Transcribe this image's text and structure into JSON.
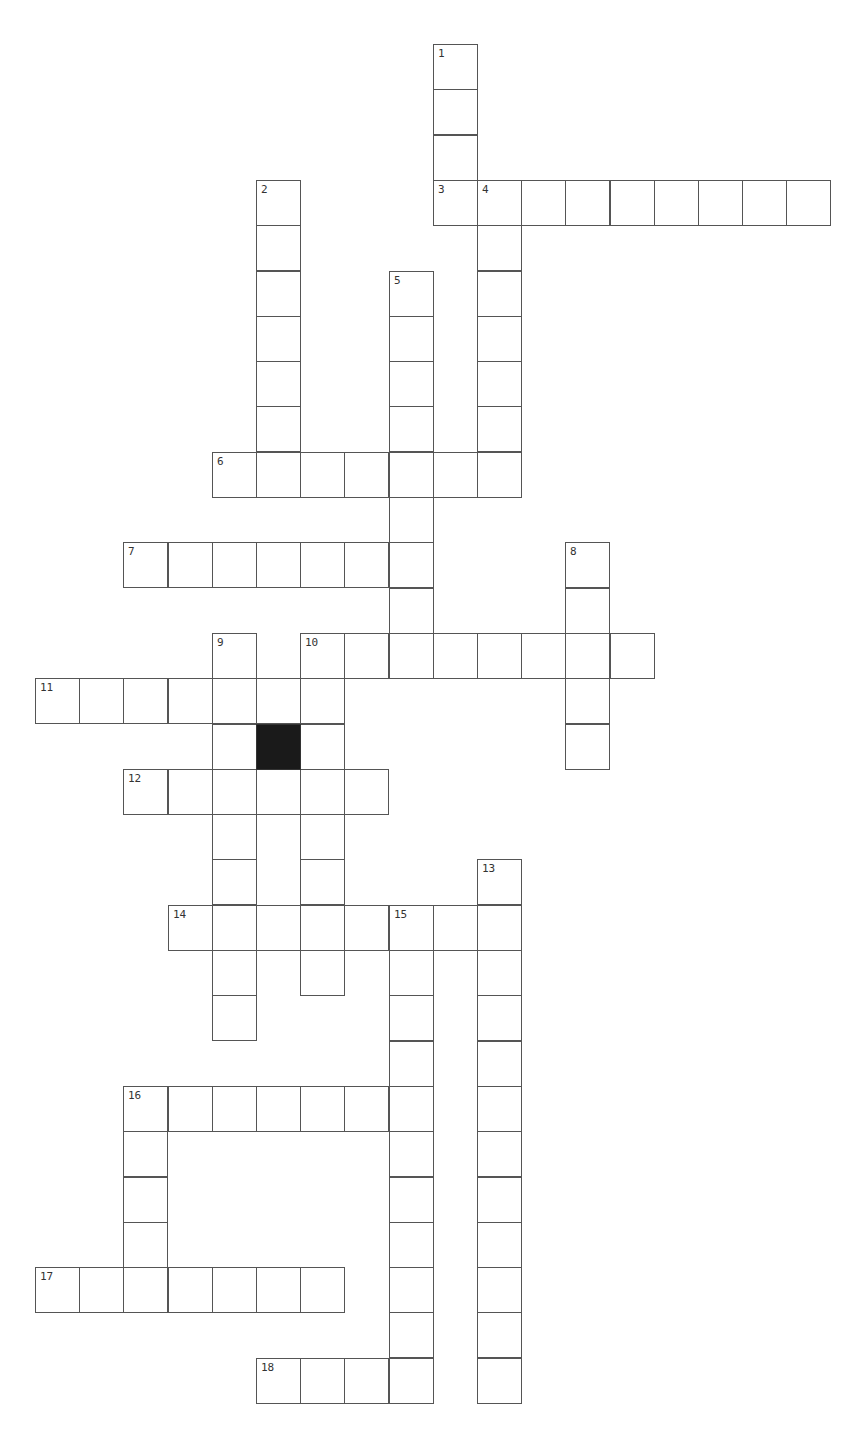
{
  "layout": {
    "left": 35,
    "top": 44,
    "cell_w": 44.2,
    "cell_h": 45.3
  },
  "colors": {
    "line": "#555555",
    "block": "#1a1a1a",
    "number": "#333333"
  },
  "words": [
    {
      "number": 1,
      "dir": "down",
      "row": 0,
      "col": 9,
      "length": 4
    },
    {
      "number": 2,
      "dir": "down",
      "row": 3,
      "col": 5,
      "length": 7
    },
    {
      "number": 3,
      "dir": "across",
      "row": 3,
      "col": 9,
      "length": 9
    },
    {
      "number": 4,
      "dir": "down",
      "row": 3,
      "col": 10,
      "length": 7
    },
    {
      "number": 5,
      "dir": "down",
      "row": 5,
      "col": 8,
      "length": 9
    },
    {
      "number": 6,
      "dir": "across",
      "row": 9,
      "col": 4,
      "length": 7
    },
    {
      "number": 7,
      "dir": "across",
      "row": 11,
      "col": 2,
      "length": 7
    },
    {
      "number": 8,
      "dir": "down",
      "row": 11,
      "col": 12,
      "length": 5
    },
    {
      "number": 9,
      "dir": "down",
      "row": 13,
      "col": 4,
      "length": 9
    },
    {
      "number": 10,
      "dir": "across",
      "row": 13,
      "col": 6,
      "length": 8
    },
    {
      "number": 10,
      "dir": "down",
      "row": 13,
      "col": 6,
      "length": 8
    },
    {
      "number": 11,
      "dir": "across",
      "row": 14,
      "col": 0,
      "length": 7
    },
    {
      "number": 12,
      "dir": "across",
      "row": 16,
      "col": 2,
      "length": 6
    },
    {
      "number": 13,
      "dir": "down",
      "row": 18,
      "col": 10,
      "length": 12
    },
    {
      "number": 14,
      "dir": "across",
      "row": 19,
      "col": 3,
      "length": 8
    },
    {
      "number": 15,
      "dir": "down",
      "row": 19,
      "col": 8,
      "length": 11
    },
    {
      "number": 16,
      "dir": "across",
      "row": 23,
      "col": 2,
      "length": 7
    },
    {
      "number": 16,
      "dir": "down",
      "row": 23,
      "col": 2,
      "length": 5
    },
    {
      "number": 17,
      "dir": "across",
      "row": 27,
      "col": 0,
      "length": 7
    },
    {
      "number": 18,
      "dir": "across",
      "row": 29,
      "col": 5,
      "length": 4
    }
  ],
  "blocks": [
    {
      "row": 15,
      "col": 5
    }
  ]
}
